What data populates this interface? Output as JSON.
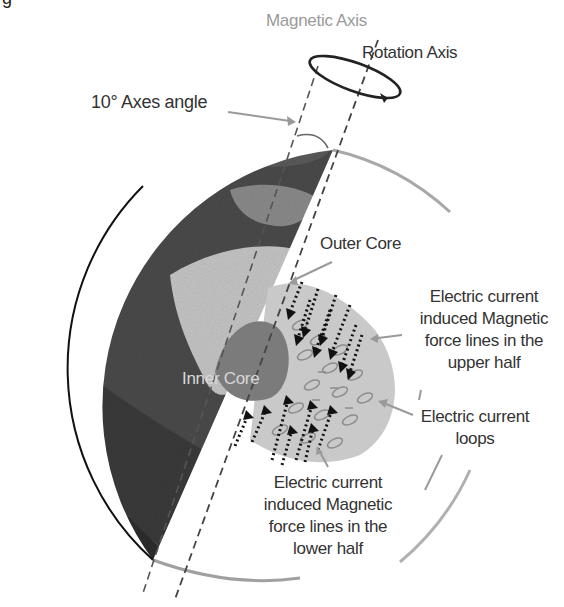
{
  "figure": {
    "title_fragment": "g",
    "colors": {
      "background": "#ffffff",
      "globe_dark": "#3c3c3c",
      "globe_mid": "#6a6a6a",
      "globe_light": "#b4b4b4",
      "outer_core": "#c8c8c8",
      "inner_core": "#7a7a7a",
      "orbit_outline": "#a8a8a8",
      "axis_dash": "#555555",
      "arrow_dark": "#111111",
      "pointer_gray": "#9a9a9a",
      "loop_gray": "#8e8e8e"
    }
  },
  "labels": {
    "magnetic_axis": "Magnetic Axis",
    "rotation_axis": "Rotation Axis",
    "axes_angle": "10° Axes angle",
    "outer_core": "Outer Core",
    "inner_core": "Inner Core",
    "upper_force_lines": [
      "Electric current",
      "induced Magnetic",
      "force lines in the",
      "upper half"
    ],
    "current_loops": [
      "Electric current",
      "loops"
    ],
    "lower_force_lines": [
      "Electric current",
      "induced Magnetic",
      "force lines in the",
      "lower half"
    ]
  },
  "icons": {
    "rotation": "rotation-ellipse-arrow-icon",
    "pointer": "pointer-arrow-icon",
    "force_arrow": "dotted-arrow-icon"
  }
}
